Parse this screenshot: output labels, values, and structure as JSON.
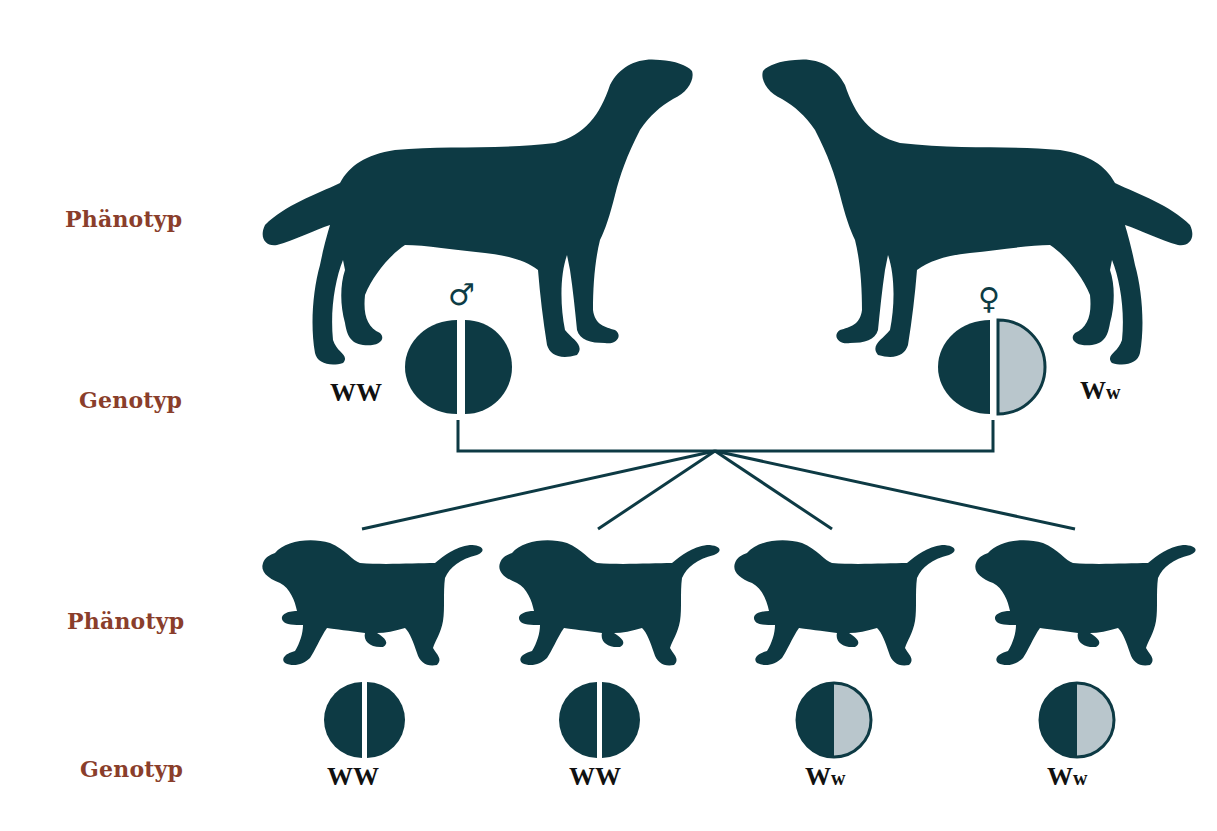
{
  "colors": {
    "silhouette": "#0d3a44",
    "recessive_fill": "#b9c6cc",
    "label": "#8a3e2b",
    "text": "#111111"
  },
  "labels": {
    "parents_phenotype": "Phänotyp",
    "parents_genotype": "Genotyp",
    "offspring_phenotype": "Phänotyp",
    "offspring_genotype": "Genotyp"
  },
  "parents": [
    {
      "sex": "male",
      "sex_symbol": "♂",
      "genotype_main": "W",
      "genotype_second": "W",
      "alleles": [
        "dominant",
        "dominant"
      ]
    },
    {
      "sex": "female",
      "sex_symbol": "♀",
      "genotype_main": "W",
      "genotype_second": "w",
      "alleles": [
        "dominant",
        "recessive"
      ]
    }
  ],
  "offspring": [
    {
      "genotype_main": "W",
      "genotype_second": "W",
      "alleles": [
        "dominant",
        "dominant"
      ]
    },
    {
      "genotype_main": "W",
      "genotype_second": "W",
      "alleles": [
        "dominant",
        "dominant"
      ]
    },
    {
      "genotype_main": "W",
      "genotype_second": "w",
      "alleles": [
        "dominant",
        "recessive"
      ]
    },
    {
      "genotype_main": "W",
      "genotype_second": "w",
      "alleles": [
        "dominant",
        "recessive"
      ]
    }
  ]
}
